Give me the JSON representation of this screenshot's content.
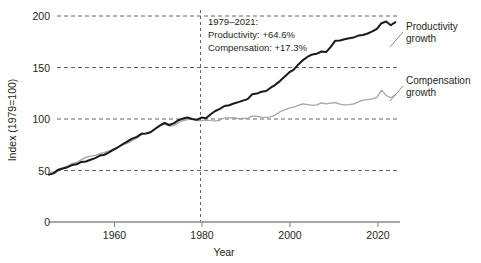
{
  "chart_data": {
    "type": "line",
    "title": "",
    "xlabel": "Year",
    "ylabel": "Index (1979=100)",
    "xlim": [
      1948,
      2024
    ],
    "ylim": [
      0,
      200
    ],
    "yticks": [
      0,
      50,
      100,
      150,
      200
    ],
    "xticks": [
      1960,
      1980,
      2000,
      2020
    ],
    "grid": "horizontal dashed at y=50,100,150,200; vertical dashed at x=1979",
    "legend_position": "right, inline labels at series ends",
    "reference_line": {
      "x": 1979,
      "style": "dashed"
    },
    "annotation": {
      "line1": "1979–2021:",
      "line2": "Productivity: +64.6%",
      "line3": "Compensation: +17.3%"
    },
    "series": [
      {
        "name": "Productivity growth",
        "label_line1": "Productivity",
        "label_line2": "growth",
        "color": "#1a1a1a",
        "width": 2.0,
        "x": [
          1948,
          1949,
          1950,
          1951,
          1952,
          1953,
          1954,
          1955,
          1956,
          1957,
          1958,
          1959,
          1960,
          1961,
          1962,
          1963,
          1964,
          1965,
          1966,
          1967,
          1968,
          1969,
          1970,
          1971,
          1972,
          1973,
          1974,
          1975,
          1976,
          1977,
          1978,
          1979,
          1980,
          1981,
          1982,
          1983,
          1984,
          1985,
          1986,
          1987,
          1988,
          1989,
          1990,
          1991,
          1992,
          1993,
          1994,
          1995,
          1996,
          1997,
          1998,
          1999,
          2000,
          2001,
          2002,
          2003,
          2004,
          2005,
          2006,
          2007,
          2008,
          2009,
          2010,
          2011,
          2012,
          2013,
          2014,
          2015,
          2016,
          2017,
          2018,
          2019,
          2020,
          2021,
          2022,
          2023
        ],
        "values": [
          46.0,
          47.2,
          50.6,
          52.0,
          53.2,
          55.3,
          56.0,
          58.3,
          58.8,
          60.5,
          62.0,
          64.5,
          65.3,
          67.6,
          70.3,
          72.8,
          75.6,
          78.2,
          81.0,
          82.6,
          85.6,
          86.0,
          87.2,
          90.5,
          93.6,
          96.3,
          94.2,
          95.8,
          98.8,
          100.4,
          101.5,
          100.0,
          99.2,
          101.4,
          100.8,
          104.6,
          107.8,
          109.8,
          112.6,
          113.4,
          115.0,
          116.4,
          117.8,
          119.3,
          124.0,
          124.7,
          126.5,
          127.2,
          130.4,
          133.2,
          136.8,
          141.0,
          145.2,
          148.0,
          153.0,
          157.2,
          160.5,
          162.6,
          163.4,
          165.5,
          165.0,
          170.0,
          176.0,
          176.3,
          177.5,
          178.3,
          179.2,
          181.0,
          181.5,
          183.0,
          185.0,
          187.5,
          193.0,
          194.6,
          191.0,
          194.0
        ]
      },
      {
        "name": "Compensation growth",
        "label_line1": "Compensation",
        "label_line2": "growth",
        "color": "#a6a6a6",
        "width": 1.3,
        "x": [
          1948,
          1949,
          1950,
          1951,
          1952,
          1953,
          1954,
          1955,
          1956,
          1957,
          1958,
          1959,
          1960,
          1961,
          1962,
          1963,
          1964,
          1965,
          1966,
          1967,
          1968,
          1969,
          1970,
          1971,
          1972,
          1973,
          1974,
          1975,
          1976,
          1977,
          1978,
          1979,
          1980,
          1981,
          1982,
          1983,
          1984,
          1985,
          1986,
          1987,
          1988,
          1989,
          1990,
          1991,
          1992,
          1993,
          1994,
          1995,
          1996,
          1997,
          1998,
          1999,
          2000,
          2001,
          2002,
          2003,
          2004,
          2005,
          2006,
          2007,
          2008,
          2009,
          2010,
          2011,
          2012,
          2013,
          2014,
          2015,
          2016,
          2017,
          2018,
          2019,
          2020,
          2021,
          2022,
          2023
        ],
        "values": [
          47.5,
          48.6,
          51.5,
          52.6,
          54.2,
          57.0,
          57.8,
          60.3,
          62.8,
          64.0,
          64.6,
          66.4,
          67.5,
          69.0,
          71.0,
          72.6,
          75.0,
          76.6,
          79.0,
          81.4,
          84.8,
          86.0,
          87.6,
          90.0,
          93.5,
          95.0,
          93.2,
          93.6,
          96.4,
          98.4,
          99.4,
          100.0,
          98.5,
          98.4,
          99.0,
          98.4,
          98.2,
          98.8,
          101.0,
          101.0,
          101.2,
          100.3,
          100.6,
          100.7,
          103.0,
          102.6,
          101.8,
          101.5,
          102.0,
          103.8,
          107.0,
          108.8,
          110.6,
          111.6,
          113.2,
          114.6,
          114.0,
          113.2,
          113.8,
          115.6,
          114.6,
          115.4,
          116.0,
          114.4,
          113.8,
          114.0,
          114.6,
          116.6,
          118.4,
          118.8,
          119.6,
          121.0,
          128.0,
          123.0,
          120.6,
          123.6
        ]
      }
    ]
  },
  "axes": {
    "ylabel": "Index (1979=100)",
    "xlabel": "Year",
    "ytick_labels": [
      "0",
      "50",
      "100",
      "150",
      "200"
    ],
    "xtick_labels": [
      "1960",
      "1980",
      "2000",
      "2020"
    ]
  },
  "annotation": {
    "line1": "1979–2021:",
    "line2": "Productivity: +64.6%",
    "line3": "Compensation: +17.3%"
  },
  "labels": {
    "productivity_1": "Productivity",
    "productivity_2": "growth",
    "compensation_1": "Compensation",
    "compensation_2": "growth"
  },
  "colors": {
    "productivity": "#1a1a1a",
    "compensation": "#a6a6a6",
    "grid": "#555555",
    "axis": "#8a8a8a",
    "background": "#ffffff"
  }
}
